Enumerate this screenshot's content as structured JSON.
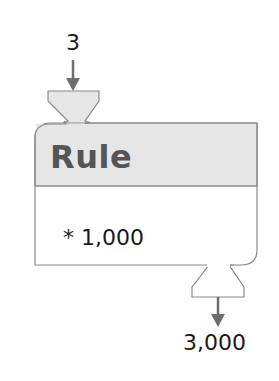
{
  "diagram": {
    "input": "3",
    "title": "Rule",
    "operation": "* 1,000",
    "output": "3,000"
  },
  "colors": {
    "header_fill": "#e6e6e6",
    "body_fill": "#ffffff",
    "stroke": "#8a8a8a",
    "arrow": "#6e6e6e",
    "title_text": "#555555"
  }
}
